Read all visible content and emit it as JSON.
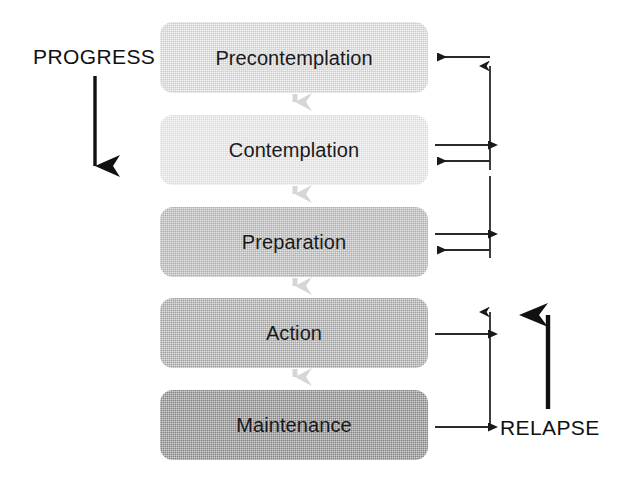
{
  "diagram": {
    "type": "flow-diagram",
    "canvas": {
      "width": 628,
      "height": 481,
      "background": "#ffffff"
    },
    "stages": [
      {
        "id": "precontemplation",
        "label": "Precontemplation",
        "fill": "#dcdcdc",
        "order": 1,
        "x": 160,
        "y": 22,
        "width": 268,
        "height": 71
      },
      {
        "id": "contemplation",
        "label": "Contemplation",
        "fill": "#e9e9e9",
        "order": 2,
        "x": 160,
        "y": 115,
        "width": 268,
        "height": 70
      },
      {
        "id": "preparation",
        "label": "Preparation",
        "fill": "#b9b9b9",
        "order": 3,
        "x": 160,
        "y": 207,
        "width": 268,
        "height": 70
      },
      {
        "id": "action",
        "label": "Action",
        "fill": "#ababab",
        "order": 4,
        "x": 160,
        "y": 298,
        "width": 268,
        "height": 70
      },
      {
        "id": "maintenance",
        "label": "Maintenance",
        "fill": "#8b8b8b",
        "order": 5,
        "x": 160,
        "y": 390,
        "width": 268,
        "height": 70
      }
    ],
    "labels": {
      "progress": "PROGRESS",
      "relapse": "RELAPSE"
    },
    "connectors": {
      "downward_color": "#d6d6d6",
      "relapse_line_color": "#1a1a1a",
      "between_stages": [
        {
          "from": "precontemplation",
          "to": "contemplation"
        },
        {
          "from": "contemplation",
          "to": "preparation"
        },
        {
          "from": "preparation",
          "to": "action"
        },
        {
          "from": "action",
          "to": "maintenance"
        }
      ],
      "relapse_arrows": [
        {
          "stage": "precontemplation",
          "direction": "into-stage"
        },
        {
          "stage": "contemplation",
          "direction": "out-of-stage"
        },
        {
          "stage": "contemplation",
          "direction": "into-stage"
        },
        {
          "stage": "preparation",
          "direction": "out-of-stage"
        },
        {
          "stage": "preparation",
          "direction": "into-stage"
        },
        {
          "stage": "action",
          "direction": "out-of-stage"
        },
        {
          "stage": "maintenance",
          "direction": "out-of-stage"
        }
      ]
    }
  }
}
